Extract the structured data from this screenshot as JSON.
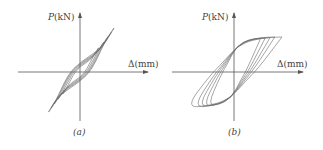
{
  "chart_data": [
    {
      "type": "line",
      "subtype": "hysteresis-loops",
      "panel_label": "(a)",
      "title": "",
      "xlabel": "Δ(mm)",
      "ylabel": "P(kN)",
      "grid": false,
      "legend": null,
      "ticks": false,
      "description": "Pinched, nearly linear hysteresis loops tilted steeply; multiple cycles with increasing amplitude, narrow loop width.",
      "loops": [
        {
          "cycle": 1,
          "dmax": 0.55,
          "pmax": 0.55
        },
        {
          "cycle": 2,
          "dmax": 0.7,
          "pmax": 0.68
        },
        {
          "cycle": 3,
          "dmax": 0.82,
          "pmax": 0.8
        },
        {
          "cycle": 4,
          "dmax": 0.92,
          "pmax": 0.9
        },
        {
          "cycle": 5,
          "dmax": 1.0,
          "pmax": 1.0
        }
      ]
    },
    {
      "type": "line",
      "subtype": "hysteresis-loops",
      "panel_label": "(b)",
      "title": "",
      "xlabel": "Δ(mm)",
      "ylabel": "P(kN)",
      "grid": false,
      "legend": null,
      "ticks": false,
      "description": "Full, fat hysteresis loops with a saturated (plateau) load; multiple cycles at increasing displacement with similar peak load.",
      "loops": [
        {
          "cycle": 1,
          "dmax": 0.55,
          "pmax": 0.95
        },
        {
          "cycle": 2,
          "dmax": 0.65,
          "pmax": 0.97
        },
        {
          "cycle": 3,
          "dmax": 0.75,
          "pmax": 0.98
        },
        {
          "cycle": 4,
          "dmax": 0.85,
          "pmax": 1.0
        },
        {
          "cycle": 5,
          "dmax": 1.0,
          "pmax": 1.0
        }
      ]
    }
  ],
  "panels": {
    "a": {
      "ylabel_var": "P",
      "ylabel_unit": "(kN)",
      "xlabel_var": "Δ",
      "xlabel_unit": "(mm)",
      "caption": "(a)"
    },
    "b": {
      "ylabel_var": "P",
      "ylabel_unit": "(kN)",
      "xlabel_var": "Δ",
      "xlabel_unit": "(mm)",
      "caption": "(b)"
    }
  },
  "colors": {
    "axis": "#555555",
    "curve": "#6a6a6a"
  }
}
